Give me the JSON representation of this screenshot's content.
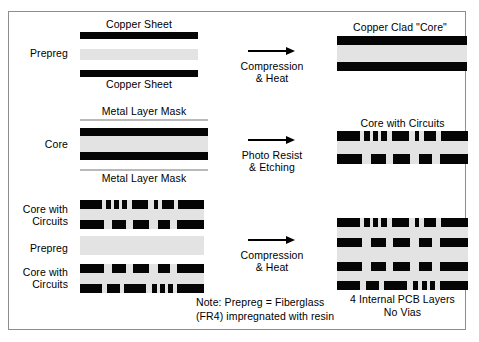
{
  "diagram": {
    "frame_border_color": "#8d8d8d",
    "copper_color": "#050505",
    "prepreg_color": "#e3e3e3",
    "mask_color": "#b9b9b9"
  },
  "rows": [
    {
      "id": "row-1",
      "left_label": "Prepreg",
      "top_label": "Copper Sheet",
      "bottom_label": "Copper Sheet",
      "arrow_label_line1": "Compression",
      "arrow_label_line2": "& Heat",
      "result_label": "Copper Clad \"Core\""
    },
    {
      "id": "row-2",
      "left_label": "Core",
      "top_label": "Metal Layer Mask",
      "bottom_label": "Metal Layer Mask",
      "arrow_label_line1": "Photo Resist",
      "arrow_label_line2": "& Etching",
      "result_label": "Core with Circuits"
    },
    {
      "id": "row-3",
      "left_label_1_line1": "Core with",
      "left_label_1_line2": "Circuits",
      "left_label_2": "Prepreg",
      "left_label_3_line1": "Core with",
      "left_label_3_line2": "Circuits",
      "arrow_label_line1": "Compression",
      "arrow_label_line2": "& Heat",
      "result_label_line1": "4 Internal PCB Layers",
      "result_label_line2": "No Vias"
    }
  ],
  "note": {
    "line1": "Note: Prepreg = Fiberglass",
    "line2": "(FR4) impregnated with resin"
  },
  "chart_data": {
    "type": "diagram",
    "stages": [
      {
        "stage": 1,
        "input_layers": [
          "Copper Sheet",
          "Prepreg",
          "Copper Sheet"
        ],
        "process": "Compression & Heat",
        "output": "Copper Clad \"Core\""
      },
      {
        "stage": 2,
        "input_layers": [
          "Metal Layer Mask",
          "Copper",
          "Core",
          "Copper",
          "Metal Layer Mask"
        ],
        "process": "Photo Resist & Etching",
        "output": "Core with Circuits"
      },
      {
        "stage": 3,
        "input_layers": [
          "Core with Circuits",
          "Prepreg",
          "Core with Circuits"
        ],
        "process": "Compression & Heat",
        "output": "4 Internal PCB Layers, No Vias"
      }
    ],
    "circuit_patterns": {
      "pattern_a": [
        [
          0,
          23
        ],
        [
          27,
          6
        ],
        [
          36,
          5
        ],
        [
          44,
          6
        ],
        [
          55,
          17
        ],
        [
          78,
          4
        ],
        [
          87,
          12
        ],
        [
          104,
          27
        ]
      ],
      "pattern_b": [
        [
          0,
          25
        ],
        [
          34,
          15
        ],
        [
          56,
          17
        ],
        [
          82,
          13
        ],
        [
          103,
          28
        ]
      ],
      "pattern_c": [
        [
          0,
          23
        ],
        [
          29,
          13
        ],
        [
          47,
          23
        ],
        [
          76,
          5
        ],
        [
          85,
          5
        ],
        [
          93,
          5
        ],
        [
          103,
          28
        ]
      ]
    }
  }
}
